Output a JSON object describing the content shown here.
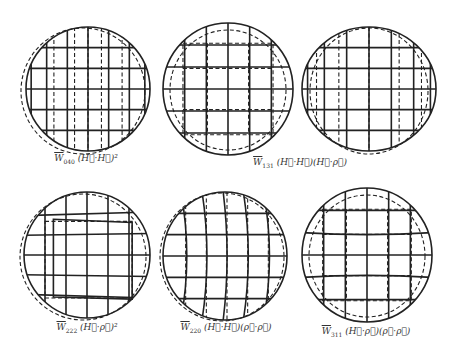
{
  "figure": {
    "colors": {
      "ink": "#222222",
      "background": "#ffffff"
    },
    "panels": [
      {
        "id": "w040",
        "coef": "W",
        "sub": "040",
        "expr": "(H⃗·H⃗)²",
        "aberration": "piston-like field term",
        "distortion": "none",
        "solid_grid": "square",
        "dashed_grid": "vertical offset lines"
      },
      {
        "id": "w131",
        "coef": "W",
        "sub": "131",
        "expr": "(H⃗·H⃗)(H⃗·ρ⃗)",
        "aberration": "field tilt",
        "distortion": "none",
        "solid_grid": "square",
        "dashed_grid": "inner square"
      },
      {
        "id": "w131b",
        "coef": "W",
        "sub": "131",
        "expr": "(H⃗·H⃗)(H⃗·ρ⃗)",
        "aberration": "continued",
        "distortion": "none",
        "solid_grid": "square",
        "dashed_grid": "vertical offset lines"
      },
      {
        "id": "w222",
        "coef": "W",
        "sub": "222",
        "expr": "(H⃗·ρ⃗)²",
        "aberration": "astigmatism",
        "distortion": "keystone",
        "solid_grid": "square",
        "dashed_grid": "trapezoid"
      },
      {
        "id": "w220",
        "coef": "W",
        "sub": "220",
        "expr": "(H⃗·H⃗)(ρ⃗·ρ⃗)",
        "aberration": "field curvature",
        "distortion": "curved verticals",
        "solid_grid": "curved",
        "dashed_grid": "straight"
      },
      {
        "id": "w311",
        "coef": "W",
        "sub": "311",
        "expr": "(H⃗·ρ⃗)(ρ⃗·ρ⃗)",
        "aberration": "distortion",
        "distortion": "barrel",
        "solid_grid": "barrel",
        "dashed_grid": "inner square"
      }
    ],
    "labels": [
      {
        "coef": "W",
        "sub": "040",
        "expr": "(H⃗·H⃗)²"
      },
      {
        "coef": "W",
        "sub": "131",
        "expr": "(H⃗·H⃗)(H⃗·ρ⃗)"
      },
      {
        "coef": "W",
        "sub": "222",
        "expr": "(H⃗·ρ⃗)²"
      },
      {
        "coef": "W",
        "sub": "220",
        "expr": "(H⃗·H⃗)(ρ⃗·ρ⃗)"
      },
      {
        "coef": "W",
        "sub": "311",
        "expr": "(H⃗·ρ⃗)(ρ⃗·ρ⃗)"
      }
    ]
  }
}
